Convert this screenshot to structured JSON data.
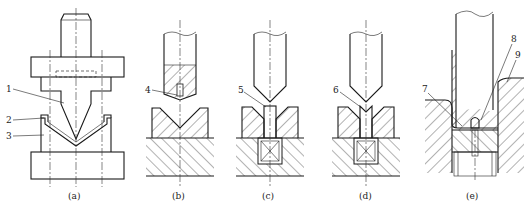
{
  "figure": {
    "panels": [
      {
        "id": "a",
        "caption": "(a)",
        "labels": [
          {
            "num": "1",
            "part": "punch"
          },
          {
            "num": "2",
            "part": "die insert"
          },
          {
            "num": "3",
            "part": "lower die"
          }
        ]
      },
      {
        "id": "b",
        "caption": "(b)",
        "labels": [
          {
            "num": "4"
          }
        ]
      },
      {
        "id": "c",
        "caption": "(c)",
        "labels": [
          {
            "num": "5"
          }
        ]
      },
      {
        "id": "d",
        "caption": "(d)",
        "labels": [
          {
            "num": "6"
          }
        ]
      },
      {
        "id": "e",
        "caption": "(e)",
        "labels": [
          {
            "num": "7"
          },
          {
            "num": "8"
          },
          {
            "num": "9"
          }
        ]
      }
    ]
  },
  "colors": {
    "line": "#1a1a1a",
    "background": "#ffffff"
  }
}
